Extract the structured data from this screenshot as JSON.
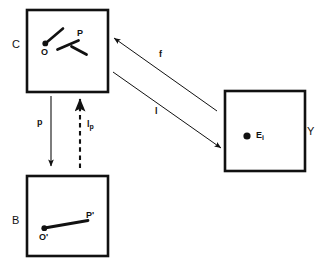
{
  "diagram": {
    "stroke_color": "#111111",
    "background_color": "#ffffff",
    "boxes": [
      {
        "id": "box-c",
        "label": "C",
        "label_position": "left-outside",
        "x": 27,
        "y": 10,
        "w": 81,
        "h": 82,
        "points": [
          {
            "name": "O",
            "label": "O",
            "dot": true,
            "x": 45,
            "y": 43
          },
          {
            "name": "P",
            "label": "P",
            "dot": false,
            "x": 79,
            "y": 37
          }
        ]
      },
      {
        "id": "box-b",
        "label": "B",
        "label_position": "left-outside",
        "x": 27,
        "y": 176,
        "w": 81,
        "h": 80,
        "points": [
          {
            "name": "O-prime",
            "label": "O'",
            "dot": true,
            "x": 44,
            "y": 228
          },
          {
            "name": "P-prime",
            "label": "P'",
            "dot": false,
            "x": 88,
            "y": 221
          }
        ]
      },
      {
        "id": "box-y",
        "label": "Y",
        "label_position": "right-outside",
        "x": 225,
        "y": 91,
        "w": 80,
        "h": 80,
        "points": [
          {
            "name": "E-i",
            "label": "E",
            "sublabel": "i",
            "dot": true,
            "x": 247,
            "y": 136
          }
        ]
      }
    ],
    "arrows": [
      {
        "id": "arrow-p",
        "label": "p",
        "sublabel": "",
        "style": "solid",
        "from": "C",
        "to": "B",
        "label_x": 37,
        "label_y": 118
      },
      {
        "id": "arrow-lp",
        "label": "l",
        "sublabel": "p",
        "style": "dashed",
        "from": "B",
        "to": "C",
        "label_x": 87,
        "label_y": 120
      },
      {
        "id": "arrow-f",
        "label": "f",
        "sublabel": "",
        "style": "solid",
        "from": "Y",
        "to": "C",
        "label_x": 159,
        "label_y": 50
      },
      {
        "id": "arrow-l",
        "label": "l",
        "sublabel": "",
        "style": "solid",
        "from": "C",
        "to": "Y",
        "label_x": 155,
        "label_y": 107
      }
    ]
  }
}
